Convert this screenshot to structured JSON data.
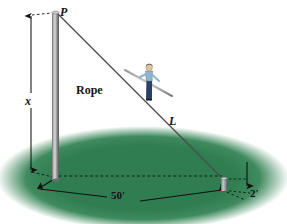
{
  "figure": {
    "type": "geometry-diagram",
    "labels": {
      "point_p": "P",
      "pole_height": "x",
      "rope_length": "L",
      "rope_word": "Rope",
      "ground_distance": "50'",
      "stake_height": "2'"
    },
    "colors": {
      "ground_green": "#2f7d51",
      "ground_green_dark": "#276b44",
      "pole_gray": "#8d8d8d",
      "pole_gray_dark": "#5c5c5c",
      "pole_highlight": "#d8d8d8",
      "rope_line": "#4a4a4a",
      "dimension_line": "#1a1a1a",
      "walker_shirt": "#8fb6cf",
      "walker_pants": "#2b3f66",
      "walker_hair": "#1d1d1d",
      "page_background": "#ffffff"
    },
    "measurements": {
      "ground_distance_value": 50,
      "ground_distance_unit": "feet",
      "stake_height_value": 2,
      "stake_height_unit": "feet",
      "pole_height_symbol": "x",
      "rope_length_symbol": "L"
    }
  }
}
